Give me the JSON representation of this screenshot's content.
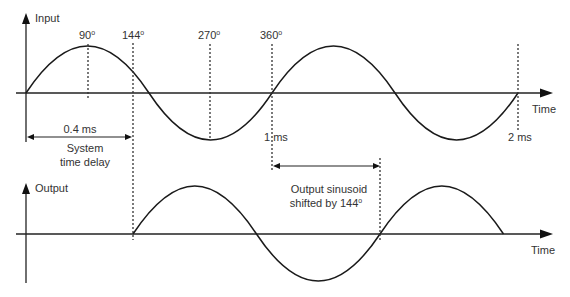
{
  "diagram": {
    "input_panel": {
      "axis_label": "Input",
      "time_label": "Time",
      "angle_markers": [
        {
          "label": "90",
          "unit": "o"
        },
        {
          "label": "144",
          "unit": "o"
        },
        {
          "label": "270",
          "unit": "o"
        },
        {
          "label": "360",
          "unit": "o"
        }
      ],
      "time_markers": [
        {
          "label": "1 ms"
        },
        {
          "label": "2 ms"
        }
      ],
      "delay_dimension": {
        "value": "0.4 ms",
        "caption_line1": "System",
        "caption_line2": "time delay"
      }
    },
    "output_panel": {
      "axis_label": "Output",
      "time_label": "Time",
      "shift_annotation": {
        "line1": "Output sinusoid",
        "line2": "shifted by 144",
        "unit": "o"
      }
    },
    "colors": {
      "stroke": "#1a1a1a",
      "text": "#333333",
      "background": "#ffffff"
    }
  }
}
